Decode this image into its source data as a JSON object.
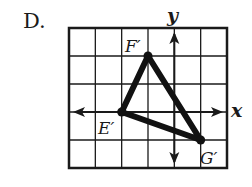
{
  "option_label": "D.",
  "axes": {
    "x_label": "x",
    "y_label": "y"
  },
  "grid": {
    "x_min": -4,
    "x_max": 2,
    "y_min": -2,
    "y_max": 3
  },
  "triangle": {
    "vertices": [
      {
        "name": "F′",
        "x": -1,
        "y": 2
      },
      {
        "name": "E′",
        "x": -2,
        "y": 0
      },
      {
        "name": "G′",
        "x": 1,
        "y": -1
      }
    ]
  },
  "colors": {
    "ink": "#1a1a1a"
  }
}
